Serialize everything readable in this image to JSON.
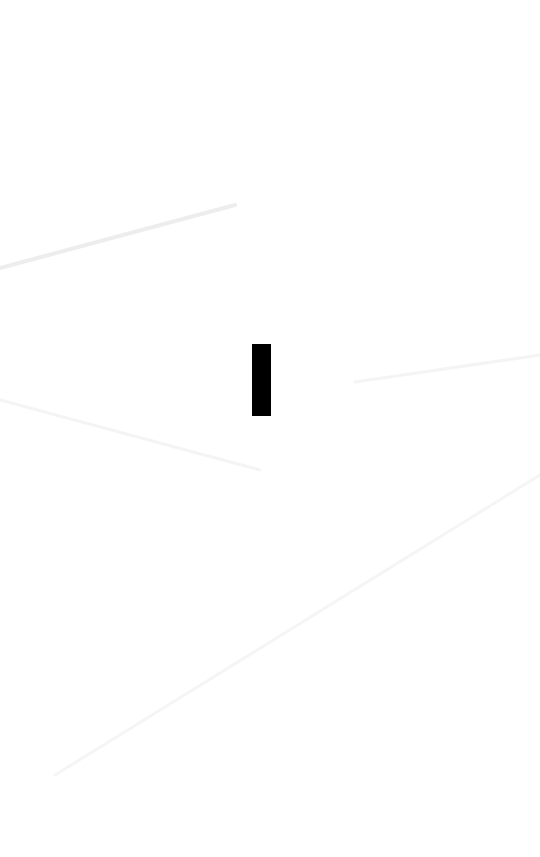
{
  "screen": {
    "background_color": "#ffffff",
    "bar": {
      "color": "#000000",
      "x": 252,
      "y": 344,
      "width": 19,
      "height": 72
    },
    "streak_color": "#ececec"
  }
}
